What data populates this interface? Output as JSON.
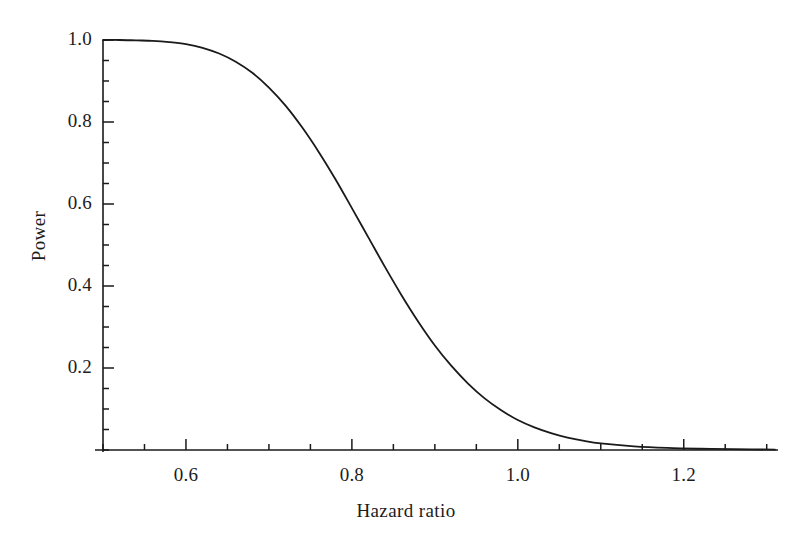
{
  "chart_data": {
    "type": "line",
    "title": "",
    "xlabel": "Hazard ratio",
    "ylabel": "Power",
    "xlim": [
      0.5,
      1.31
    ],
    "ylim": [
      0.0,
      1.02
    ],
    "grid": false,
    "legend": null,
    "x_ticks_major": [
      0.6,
      0.8,
      1.0,
      1.2
    ],
    "x_tick_labels": [
      "0.6",
      "0.8",
      "1.0",
      "1.2"
    ],
    "x_ticks_minor_step": 0.05,
    "y_ticks_major": [
      0.2,
      0.4,
      0.6,
      0.8,
      1.0
    ],
    "y_tick_labels": [
      "0.2",
      "0.4",
      "0.6",
      "0.8",
      "1.0"
    ],
    "y_ticks_minor_step": 0.05,
    "line_color": "#1a1a1a",
    "line_width": 1.8,
    "series": [
      {
        "name": "Power",
        "x": [
          0.5,
          0.52,
          0.54,
          0.56,
          0.58,
          0.6,
          0.62,
          0.64,
          0.66,
          0.68,
          0.7,
          0.72,
          0.74,
          0.76,
          0.78,
          0.8,
          0.82,
          0.84,
          0.86,
          0.88,
          0.9,
          0.92,
          0.94,
          0.96,
          0.98,
          1.0,
          1.02,
          1.04,
          1.06,
          1.08,
          1.1,
          1.14,
          1.18,
          1.22,
          1.26,
          1.31
        ],
        "values": [
          1.0,
          1.0,
          0.999,
          0.998,
          0.995,
          0.99,
          0.981,
          0.967,
          0.947,
          0.92,
          0.884,
          0.84,
          0.787,
          0.727,
          0.661,
          0.59,
          0.518,
          0.446,
          0.377,
          0.313,
          0.255,
          0.205,
          0.162,
          0.126,
          0.097,
          0.073,
          0.055,
          0.041,
          0.03,
          0.022,
          0.016,
          0.009,
          0.005,
          0.003,
          0.002,
          0.001
        ]
      }
    ]
  },
  "axis": {
    "x_title": "Hazard ratio",
    "y_title": "Power"
  }
}
